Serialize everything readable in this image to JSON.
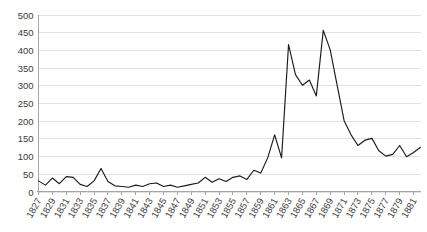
{
  "chart_data": {
    "type": "line",
    "title": "",
    "subtitle": "",
    "xlabel": "",
    "ylabel": "",
    "ylim": [
      0,
      500
    ],
    "ytick_step": 50,
    "yticks": [
      0,
      50,
      100,
      150,
      200,
      250,
      300,
      350,
      400,
      450,
      500
    ],
    "xlim": [
      1827,
      1882
    ],
    "xtick_step": 2,
    "xticks": [
      "1827",
      "1829",
      "1831",
      "1833",
      "1835",
      "1837",
      "1839",
      "1841",
      "1843",
      "1845",
      "1847",
      "1849",
      "1851",
      "1853",
      "1855",
      "1857",
      "1859",
      "1861",
      "1863",
      "1865",
      "1867",
      "1869",
      "1871",
      "1873",
      "1875",
      "1877",
      "1879",
      "1881"
    ],
    "grid": true,
    "grid_axis": "y",
    "legend": false,
    "legend_position": "none",
    "annotations": [],
    "series": [
      {
        "name": "series-1",
        "color": "#1b1b1b",
        "x": [
          1827,
          1828,
          1829,
          1830,
          1831,
          1832,
          1833,
          1834,
          1835,
          1836,
          1837,
          1838,
          1839,
          1840,
          1841,
          1842,
          1843,
          1844,
          1845,
          1846,
          1847,
          1848,
          1849,
          1850,
          1851,
          1852,
          1853,
          1854,
          1855,
          1856,
          1857,
          1858,
          1859,
          1860,
          1861,
          1862,
          1863,
          1864,
          1865,
          1866,
          1867,
          1868,
          1869,
          1870,
          1871,
          1872,
          1873,
          1874,
          1875,
          1876,
          1877,
          1878,
          1879,
          1880,
          1881,
          1882
        ],
        "values": [
          30,
          18,
          38,
          22,
          42,
          40,
          20,
          14,
          30,
          65,
          28,
          16,
          14,
          12,
          18,
          14,
          22,
          24,
          14,
          18,
          12,
          16,
          20,
          24,
          40,
          26,
          36,
          28,
          40,
          44,
          34,
          60,
          52,
          95,
          160,
          95,
          415,
          330,
          300,
          315,
          270,
          455,
          400,
          300,
          200,
          160,
          130,
          145,
          150,
          115,
          100,
          105,
          130,
          98,
          110,
          125
        ]
      }
    ]
  }
}
